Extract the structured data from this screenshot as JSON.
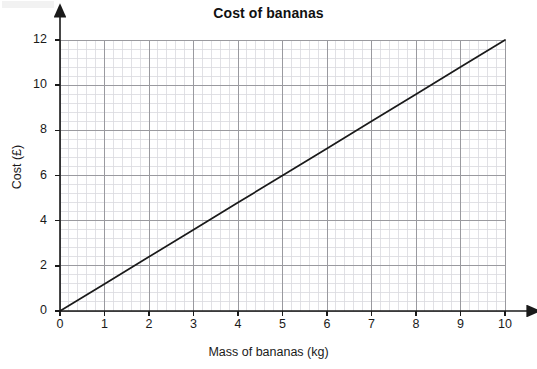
{
  "chart_data": {
    "type": "line",
    "title": "Cost of bananas",
    "xlabel": "Mass of bananas (kg)",
    "ylabel": "Cost (£)",
    "xlim": [
      0,
      10
    ],
    "ylim": [
      0,
      12
    ],
    "xticks": [
      0,
      1,
      2,
      3,
      4,
      5,
      6,
      7,
      8,
      9,
      10
    ],
    "yticks": [
      0,
      2,
      4,
      6,
      8,
      10,
      12
    ],
    "xtick_labels": [
      "0",
      "1",
      "2",
      "3",
      "4",
      "5",
      "6",
      "7",
      "8",
      "9",
      "10"
    ],
    "ytick_labels": [
      "0",
      "2",
      "4",
      "6",
      "8",
      "10",
      "12"
    ],
    "grid": true,
    "grid_major_x_step": 1,
    "grid_major_y_step": 2,
    "grid_minor_x_step": 0.2,
    "grid_minor_y_step": 0.4,
    "legend": null,
    "axis_arrows": true,
    "series": [
      {
        "name": "Cost of bananas",
        "relationship": "y = 1.2x",
        "x": [
          0,
          1,
          2,
          3,
          4,
          5,
          6,
          7,
          8,
          9,
          10
        ],
        "values": [
          0,
          1.2,
          2.4,
          3.6,
          4.8,
          6.0,
          7.2,
          8.4,
          9.6,
          10.8,
          12.0
        ],
        "color": "#1a1a1a"
      }
    ]
  },
  "colors": {
    "line": "#1a1a1a",
    "axis": "#1a1a1a",
    "grid_major": "#9a9a9f",
    "grid_minor": "#d9d9de",
    "text": "#1a1a1a",
    "background": "#ffffff"
  }
}
